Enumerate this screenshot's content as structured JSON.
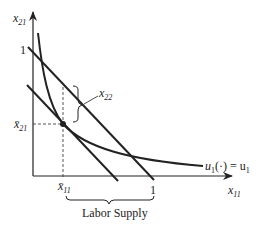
{
  "diagram": {
    "type": "economics-labor-supply",
    "axes": {
      "y_label": "x",
      "y_label_sub": "21",
      "x_label": "x",
      "x_label_sub": "11",
      "y_tick": "1",
      "x_tick": "1"
    },
    "points": {
      "x_bar_label": "x̄",
      "x_bar_sub": "11",
      "y_bar_label": "x̄",
      "y_bar_sub": "21"
    },
    "annotations": {
      "x22_label": "x",
      "x22_sub": "22",
      "utility_label_prefix": "u",
      "utility_label_sub": "1",
      "utility_label_mid": "(·) = u",
      "utility_label_sub2": "1",
      "brace_label": "Labor Supply"
    },
    "colors": {
      "line": "#222222",
      "background": "#ffffff"
    }
  }
}
